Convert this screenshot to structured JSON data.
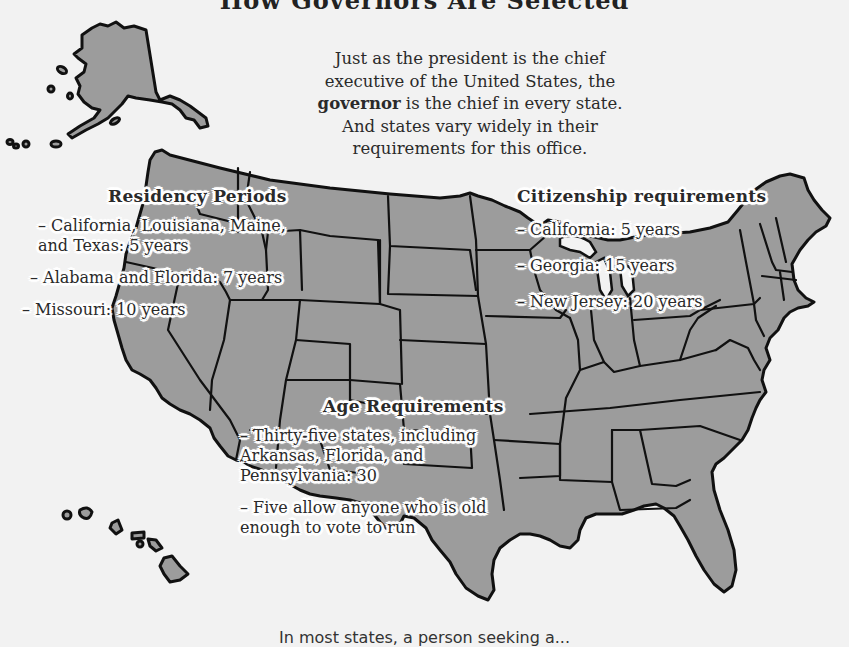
{
  "title_fragment": "How Governors Are Selected",
  "intro": {
    "line1": "Just as the president is the chief",
    "line2": "executive of the United States, the",
    "line3_bold": "governor",
    "line3_rest": " is the chief in every state.",
    "line4": "And states vary widely in their",
    "line5": "requirements for this office."
  },
  "residency": {
    "heading": "Residency Periods",
    "items": [
      "– California, Louisiana, Maine,\nand Texas: 5 years",
      "– Alabama and Florida: 7 years",
      "– Missouri: 10 years"
    ]
  },
  "citizenship": {
    "heading": "Citizenship requirements",
    "items": [
      "– California: 5 years",
      "– Georgia: 15 years",
      "– New Jersey: 20 years"
    ]
  },
  "age": {
    "heading": "Age Requirements",
    "items": [
      "– Thirty-five states, including\nArkansas, Florida, and\nPennsylvania: 30",
      "– Five allow anyone who is old\nenough to vote to run"
    ]
  },
  "footer_fragment": "In most states, a person seeking a...",
  "colors": {
    "background": "#f2f2f2",
    "land": "#9c9c9c",
    "outline": "#111111",
    "text": "#2a2a2a"
  }
}
